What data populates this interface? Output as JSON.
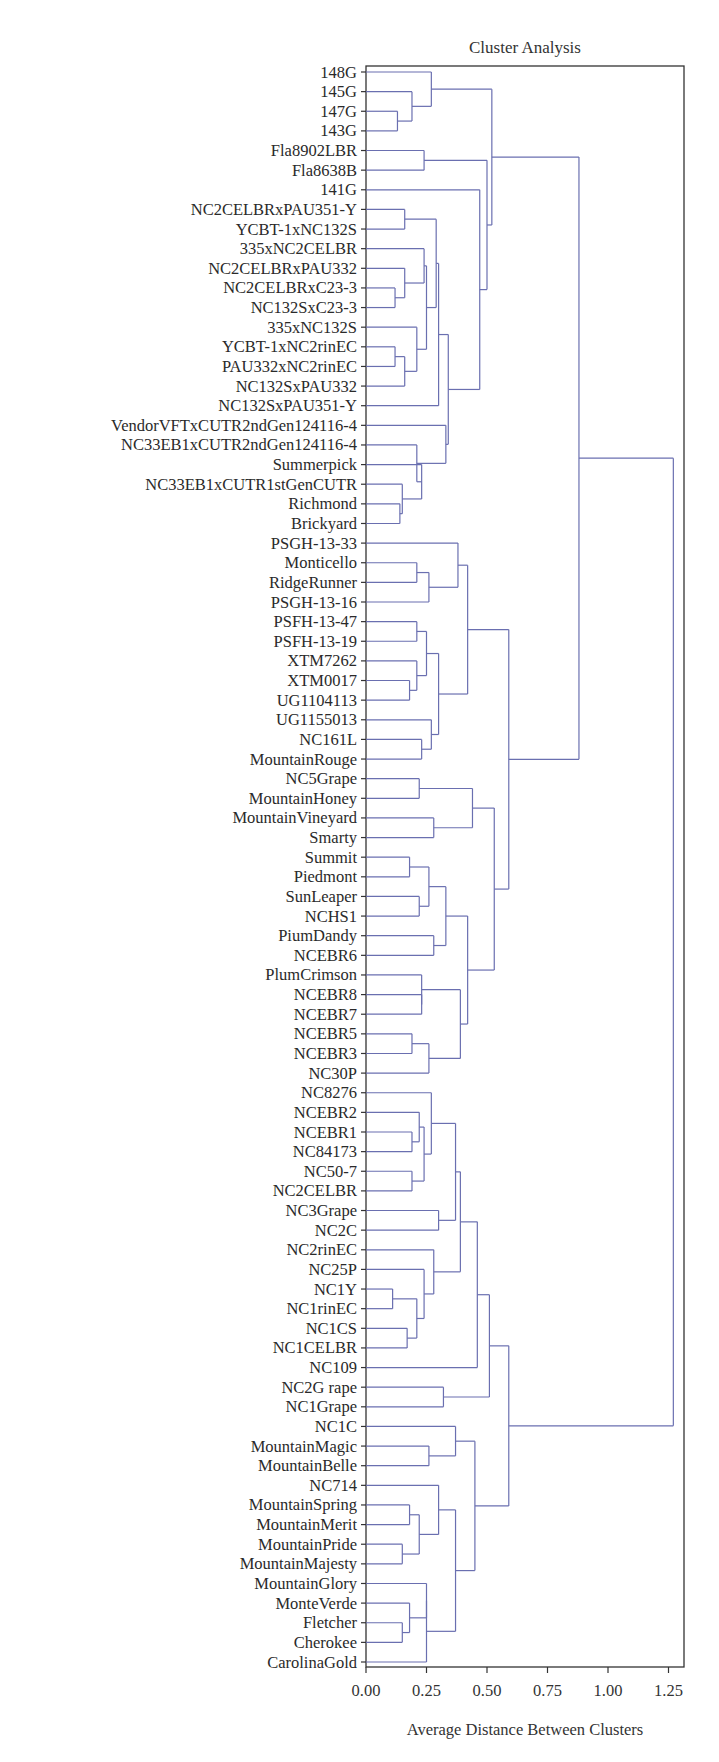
{
  "chart_data": {
    "type": "dendrogram",
    "title": "Cluster Analysis",
    "xlabel": "Average Distance Between Clusters",
    "ylabel": "",
    "xlim": [
      0,
      1.3
    ],
    "xticks": [
      0.0,
      0.25,
      0.5,
      0.75,
      1.0,
      1.25
    ],
    "xtick_labels": [
      "0.00",
      "0.25",
      "0.50",
      "0.75",
      "1.00",
      "1.25"
    ],
    "line_color": "#6a6fb0",
    "frame_color": "#333333",
    "leaves": [
      "148G",
      "145G",
      "147G",
      "143G",
      "Fla8902LBR",
      "Fla8638B",
      "141G",
      "NC2CELBRxPAU351-Y",
      "YCBT-1xNC132S",
      "335xNC2CELBR",
      "NC2CELBRxPAU332",
      "NC2CELBRxC23-3",
      "NC132SxC23-3",
      "335xNC132S",
      "YCBT-1xNC2rinEC",
      "PAU332xNC2rinEC",
      "NC132SxPAU332",
      "NC132SxPAU351-Y",
      "VendorVFTxCUTR2ndGen124116-4",
      "NC33EB1xCUTR2ndGen124116-4",
      "Summerpick",
      "NC33EB1xCUTR1stGenCUTR",
      "Richmond",
      "Brickyard",
      "PSGH-13-33",
      "Monticello",
      "RidgeRunner",
      "PSGH-13-16",
      "PSFH-13-47",
      "PSFH-13-19",
      "XTM7262",
      "XTM0017",
      "UG1104113",
      "UG1155013",
      "NC161L",
      "MountainRouge",
      "NC5Grape",
      "MountainHoney",
      "MountainVineyard",
      "Smarty",
      "Summit",
      "Piedmont",
      "SunLeaper",
      "NCHS1",
      "PiumDandy",
      "NCEBR6",
      "PlumCrimson",
      "NCEBR8",
      "NCEBR7",
      "NCEBR5",
      "NCEBR3",
      "NC30P",
      "NC8276",
      "NCEBR2",
      "NCEBR1",
      "NC84173",
      "NC50-7",
      "NC2CELBR",
      "NC3Grape",
      "NC2C",
      "NC2rinEC",
      "NC25P",
      "NC1Y",
      "NC1rinEC",
      "NC1CS",
      "NC1CELBR",
      "NC109",
      "NC2G rape",
      "NC1Grape",
      "NC1C",
      "MountainMagic",
      "MountainBelle",
      "NC714",
      "MountainSpring",
      "MountainMerit",
      "MountainPride",
      "MountainMajesty",
      "MountainGlory",
      "MonteVerde",
      "Fletcher",
      "Cherokee",
      "CarolinaGold"
    ],
    "merges": [
      {
        "id": "m1",
        "a": 2,
        "b": 3,
        "h": 0.13
      },
      {
        "id": "m2",
        "a": 1,
        "b": "m1",
        "h": 0.19
      },
      {
        "id": "m3",
        "a": 0,
        "b": "m2",
        "h": 0.27
      },
      {
        "id": "m4",
        "a": 4,
        "b": 5,
        "h": 0.24
      },
      {
        "id": "m5",
        "a": 7,
        "b": 8,
        "h": 0.16
      },
      {
        "id": "m6",
        "a": 11,
        "b": 12,
        "h": 0.12
      },
      {
        "id": "m7",
        "a": 10,
        "b": "m6",
        "h": 0.16
      },
      {
        "id": "m8",
        "a": 9,
        "b": "m7",
        "h": 0.24
      },
      {
        "id": "m9",
        "a": 14,
        "b": 15,
        "h": 0.12
      },
      {
        "id": "m10",
        "a": "m9",
        "b": 16,
        "h": 0.16
      },
      {
        "id": "m11",
        "a": 13,
        "b": "m10",
        "h": 0.21
      },
      {
        "id": "m12",
        "a": "m8",
        "b": "m11",
        "h": 0.25
      },
      {
        "id": "m13",
        "a": "m5",
        "b": "m12",
        "h": 0.29
      },
      {
        "id": "m14",
        "a": "m13",
        "b": 17,
        "h": 0.3
      },
      {
        "id": "m15",
        "a": 22,
        "b": 23,
        "h": 0.14
      },
      {
        "id": "m16",
        "a": 21,
        "b": "m15",
        "h": 0.15
      },
      {
        "id": "m17",
        "a": 20,
        "b": "m16",
        "h": 0.23
      },
      {
        "id": "m18",
        "a": 19,
        "b": "m17",
        "h": 0.21
      },
      {
        "id": "m19",
        "a": 18,
        "b": "m18",
        "h": 0.33
      },
      {
        "id": "m20",
        "a": "m14",
        "b": "m19",
        "h": 0.34
      },
      {
        "id": "m21",
        "a": 6,
        "b": "m20",
        "h": 0.47
      },
      {
        "id": "m22",
        "a": "m4",
        "b": "m21",
        "h": 0.5
      },
      {
        "id": "m23",
        "a": "m3",
        "b": "m22",
        "h": 0.52
      },
      {
        "id": "m24",
        "a": 25,
        "b": 26,
        "h": 0.21
      },
      {
        "id": "m25",
        "a": "m24",
        "b": 27,
        "h": 0.26
      },
      {
        "id": "m26",
        "a": 24,
        "b": "m25",
        "h": 0.38
      },
      {
        "id": "m27",
        "a": 28,
        "b": 29,
        "h": 0.21
      },
      {
        "id": "m28",
        "a": 31,
        "b": 32,
        "h": 0.18
      },
      {
        "id": "m29",
        "a": 30,
        "b": "m28",
        "h": 0.21
      },
      {
        "id": "m30",
        "a": "m27",
        "b": "m29",
        "h": 0.25
      },
      {
        "id": "m31",
        "a": 34,
        "b": 35,
        "h": 0.23
      },
      {
        "id": "m32",
        "a": 33,
        "b": "m31",
        "h": 0.27
      },
      {
        "id": "m33",
        "a": "m30",
        "b": "m32",
        "h": 0.3
      },
      {
        "id": "m34",
        "a": "m26",
        "b": "m33",
        "h": 0.42
      },
      {
        "id": "m35",
        "a": 36,
        "b": 37,
        "h": 0.22
      },
      {
        "id": "m36",
        "a": 38,
        "b": 39,
        "h": 0.28
      },
      {
        "id": "m37",
        "a": "m35",
        "b": "m36",
        "h": 0.44
      },
      {
        "id": "m38",
        "a": 40,
        "b": 41,
        "h": 0.18
      },
      {
        "id": "m39",
        "a": 42,
        "b": 43,
        "h": 0.22
      },
      {
        "id": "m40",
        "a": "m38",
        "b": "m39",
        "h": 0.26
      },
      {
        "id": "m41",
        "a": 44,
        "b": 45,
        "h": 0.28
      },
      {
        "id": "m42",
        "a": "m40",
        "b": "m41",
        "h": 0.33
      },
      {
        "id": "m43",
        "a": 47,
        "b": 48,
        "h": 0.23
      },
      {
        "id": "m44",
        "a": 46,
        "b": "m43",
        "h": 0.23
      },
      {
        "id": "m45",
        "a": 49,
        "b": 50,
        "h": 0.19
      },
      {
        "id": "m46",
        "a": "m45",
        "b": 51,
        "h": 0.26
      },
      {
        "id": "m47",
        "a": "m44",
        "b": "m46",
        "h": 0.39
      },
      {
        "id": "m48",
        "a": "m42",
        "b": "m47",
        "h": 0.42
      },
      {
        "id": "m49",
        "a": "m37",
        "b": "m48",
        "h": 0.53
      },
      {
        "id": "m50",
        "a": "m34",
        "b": "m49",
        "h": 0.59
      },
      {
        "id": "m51",
        "a": "m23",
        "b": "m50",
        "h": 0.88
      },
      {
        "id": "m52",
        "a": 54,
        "b": 55,
        "h": 0.19
      },
      {
        "id": "m53",
        "a": 53,
        "b": "m52",
        "h": 0.22
      },
      {
        "id": "m54",
        "a": 56,
        "b": 57,
        "h": 0.19
      },
      {
        "id": "m55",
        "a": "m53",
        "b": "m54",
        "h": 0.24
      },
      {
        "id": "m56",
        "a": 52,
        "b": "m55",
        "h": 0.27
      },
      {
        "id": "m57",
        "a": 58,
        "b": 59,
        "h": 0.3
      },
      {
        "id": "m58",
        "a": "m56",
        "b": "m57",
        "h": 0.37
      },
      {
        "id": "m59",
        "a": 62,
        "b": 63,
        "h": 0.11
      },
      {
        "id": "m60",
        "a": 64,
        "b": 65,
        "h": 0.17
      },
      {
        "id": "m61",
        "a": "m59",
        "b": "m60",
        "h": 0.21
      },
      {
        "id": "m62",
        "a": 61,
        "b": "m61",
        "h": 0.24
      },
      {
        "id": "m63",
        "a": 60,
        "b": "m62",
        "h": 0.28
      },
      {
        "id": "m64",
        "a": "m58",
        "b": "m63",
        "h": 0.39
      },
      {
        "id": "m65",
        "a": "m64",
        "b": 66,
        "h": 0.46
      },
      {
        "id": "m66",
        "a": 67,
        "b": 68,
        "h": 0.32
      },
      {
        "id": "m67",
        "a": "m65",
        "b": "m66",
        "h": 0.51
      },
      {
        "id": "m68",
        "a": 70,
        "b": 71,
        "h": 0.26
      },
      {
        "id": "m69",
        "a": 69,
        "b": "m68",
        "h": 0.37
      },
      {
        "id": "m70",
        "a": 73,
        "b": 74,
        "h": 0.18
      },
      {
        "id": "m71",
        "a": 75,
        "b": 76,
        "h": 0.15
      },
      {
        "id": "m72",
        "a": "m70",
        "b": "m71",
        "h": 0.22
      },
      {
        "id": "m73",
        "a": 72,
        "b": "m72",
        "h": 0.3
      },
      {
        "id": "m74",
        "a": 79,
        "b": 80,
        "h": 0.15
      },
      {
        "id": "m75",
        "a": 78,
        "b": "m74",
        "h": 0.18
      },
      {
        "id": "m76",
        "a": 77,
        "b": "m75",
        "h": 0.25
      },
      {
        "id": "m77",
        "a": "m76",
        "b": 81,
        "h": 0.25
      },
      {
        "id": "m78",
        "a": "m73",
        "b": "m77",
        "h": 0.37
      },
      {
        "id": "m79",
        "a": "m69",
        "b": "m78",
        "h": 0.45
      },
      {
        "id": "m80",
        "a": "m67",
        "b": "m79",
        "h": 0.59
      },
      {
        "id": "m81",
        "a": "m51",
        "b": "m80",
        "h": 1.27
      }
    ]
  },
  "layout": {
    "plot_left": 366,
    "plot_right": 684,
    "plot_top": 66,
    "plot_bottom": 1667,
    "px_per_unit": 242,
    "leaf_first_y": 72,
    "leaf_last_y": 1662
  }
}
